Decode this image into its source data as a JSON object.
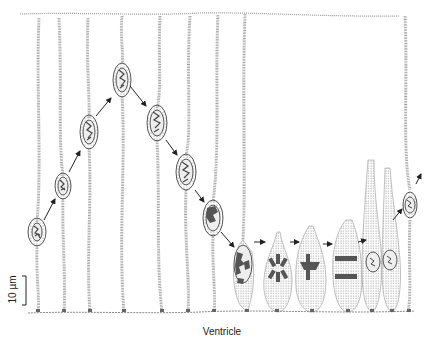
{
  "figure": {
    "labels": {
      "scale_bar": "10 µm",
      "bottom_surface": "Ventricle"
    },
    "colors": {
      "stipple": "#9a9a9a",
      "nucleus_fill": "#e8e8e8",
      "chromatin": "#555555",
      "arrow": "#222222",
      "text": "#222222"
    },
    "cells": [
      {
        "x": 37,
        "nucleus_y": 232,
        "stage": "G1"
      },
      {
        "x": 63,
        "nucleus_y": 186,
        "stage": "S"
      },
      {
        "x": 89,
        "nucleus_y": 132,
        "stage": "S"
      },
      {
        "x": 122,
        "nucleus_y": 80,
        "stage": "S"
      },
      {
        "x": 157,
        "nucleus_y": 123,
        "stage": "G2"
      },
      {
        "x": 186,
        "nucleus_y": 172,
        "stage": "G2"
      },
      {
        "x": 213,
        "nucleus_y": 218,
        "stage": "G2"
      },
      {
        "x": 243,
        "nucleus_y": 262,
        "stage": "Prophase"
      },
      {
        "x": 277,
        "nucleus_y": 268,
        "stage": "Prometaphase"
      },
      {
        "x": 310,
        "nucleus_y": 270,
        "stage": "Metaphase"
      },
      {
        "x": 346,
        "nucleus_y": 262,
        "stage": "Anaphase"
      },
      {
        "x": 373,
        "nucleus_y": 262,
        "stage": "Daughter"
      },
      {
        "x": 390,
        "nucleus_y": 260,
        "stage": "Daughter"
      },
      {
        "x": 410,
        "nucleus_y": 205,
        "stage": "G1"
      }
    ]
  }
}
